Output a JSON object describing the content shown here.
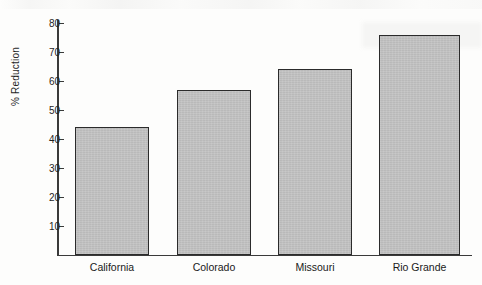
{
  "chart_data": {
    "type": "bar",
    "title": "",
    "xlabel": "",
    "ylabel": "% Reduction",
    "categories": [
      "California",
      "Colorado",
      "Missouri",
      "Rio Grande"
    ],
    "values": [
      44,
      57,
      64,
      76
    ],
    "ylim": [
      0,
      80
    ],
    "yticks": [
      10,
      20,
      30,
      40,
      50,
      60,
      70,
      80
    ],
    "ytick_labels": [
      "10",
      "20",
      "30",
      "40",
      "50",
      "60",
      "70",
      "80"
    ],
    "grid": false,
    "legend": null,
    "legend_position": "none",
    "orientation": "vertical",
    "bar_fill_color": "#c4c4c4",
    "bar_edge_color": "#2b2b2b",
    "axis_color": "#3a3a3a",
    "background_color": "#fdfdfc"
  },
  "axes": {
    "y_title": "% Reduction",
    "ticks": [
      {
        "label": "80",
        "value": 80
      },
      {
        "label": "70",
        "value": 70
      },
      {
        "label": "60",
        "value": 60
      },
      {
        "label": "50",
        "value": 50
      },
      {
        "label": "40",
        "value": 40
      },
      {
        "label": "30",
        "value": 30
      },
      {
        "label": "20",
        "value": 20
      },
      {
        "label": "10",
        "value": 10
      }
    ]
  },
  "series": [
    {
      "category": "California",
      "value": 44
    },
    {
      "category": "Colorado",
      "value": 57
    },
    {
      "category": "Missouri",
      "value": 64
    },
    {
      "category": "Rio Grande",
      "value": 76
    }
  ]
}
